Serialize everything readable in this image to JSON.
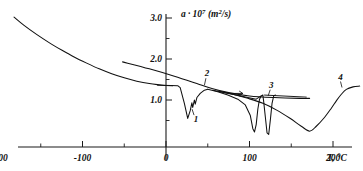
{
  "chart_data": {
    "type": "line",
    "title": "",
    "xlabel": "T, °C",
    "ylabel": "a · 10⁷ (m²/s)",
    "ylabel_parts": {
      "symbol": "a",
      "dot": "·",
      "base": "10",
      "exponent": "7",
      "units": "(m²/s)"
    },
    "xlim": [
      -230,
      245
    ],
    "ylim": [
      0.0,
      3.25
    ],
    "grid": false,
    "legend": "inline-numbered-labels",
    "x_ticks_major": [
      -200,
      -100,
      0,
      100,
      200
    ],
    "x_ticks_major_labels": [
      "-200",
      "-100",
      "0",
      "100",
      "200"
    ],
    "x_ticks_minor": [
      -150,
      -50,
      50,
      150
    ],
    "y_ticks_major": [
      1.0,
      2.0,
      3.0
    ],
    "y_ticks_major_labels": [
      "1.0",
      "2.0",
      "3.0"
    ],
    "y_ticks_minor": [
      0.5,
      1.5,
      2.5
    ],
    "series": [
      {
        "name": "background-decay-curve",
        "label": "",
        "comment": "smooth monotonic decay from low temperature",
        "points": [
          [
            -182,
            3.02
          ],
          [
            -170,
            2.82
          ],
          [
            -155,
            2.6
          ],
          [
            -140,
            2.4
          ],
          [
            -125,
            2.22
          ],
          [
            -110,
            2.05
          ],
          [
            -95,
            1.9
          ],
          [
            -80,
            1.76
          ],
          [
            -65,
            1.64
          ],
          [
            -50,
            1.54
          ],
          [
            -35,
            1.46
          ],
          [
            -20,
            1.4
          ],
          [
            -8,
            1.37
          ],
          [
            0,
            1.355
          ],
          [
            8,
            1.35
          ]
        ]
      },
      {
        "name": "curve-1",
        "label": "1",
        "comment": "plateau then sharp deep dip near 27 C with zigzag recovery",
        "points": [
          [
            -10,
            1.36
          ],
          [
            6,
            1.355
          ],
          [
            14,
            1.35
          ],
          [
            17,
            1.3
          ],
          [
            22,
            0.92
          ],
          [
            26,
            0.55
          ],
          [
            29,
            0.74
          ],
          [
            31,
            0.93
          ],
          [
            32,
            0.82
          ],
          [
            34,
            1.0
          ],
          [
            35,
            0.9
          ],
          [
            37,
            1.06
          ],
          [
            41,
            1.16
          ],
          [
            46,
            1.24
          ],
          [
            50,
            1.26
          ]
        ],
        "label_pos": [
          36,
          0.46
        ]
      },
      {
        "name": "curve-2",
        "label": "2",
        "comment": "straight descending baseline from -50 C crossing to the right",
        "points": [
          [
            -52,
            1.93
          ],
          [
            -20,
            1.76
          ],
          [
            10,
            1.58
          ],
          [
            40,
            1.38
          ],
          [
            55,
            1.28
          ],
          [
            75,
            1.18
          ],
          [
            100,
            1.1
          ],
          [
            130,
            1.06
          ],
          [
            160,
            1.04
          ],
          [
            172,
            1.04
          ]
        ],
        "label_pos": [
          49,
          1.58
        ]
      },
      {
        "name": "curve-2-dip-a",
        "label": "",
        "comment": "narrow deep dip near 105 C",
        "points": [
          [
            50,
            1.26
          ],
          [
            62,
            1.2
          ],
          [
            74,
            1.12
          ],
          [
            86,
            1.02
          ],
          [
            95,
            0.88
          ],
          [
            101,
            0.62
          ],
          [
            104,
            0.3
          ],
          [
            106,
            0.22
          ],
          [
            108,
            0.4
          ],
          [
            110,
            0.78
          ],
          [
            112,
            1.02
          ],
          [
            114,
            1.1
          ]
        ]
      },
      {
        "name": "curve-3",
        "label": "3",
        "comment": "narrow deep dip near 122 C with horizontal plateau afterwards",
        "points": [
          [
            56,
            1.24
          ],
          [
            70,
            1.18
          ],
          [
            84,
            1.12
          ],
          [
            98,
            1.06
          ],
          [
            108,
            1.02
          ],
          [
            114,
            1.1
          ],
          [
            116,
            1.12
          ],
          [
            117,
            0.96
          ],
          [
            119,
            0.58
          ],
          [
            121,
            0.2
          ],
          [
            123,
            0.16
          ],
          [
            125,
            0.52
          ],
          [
            127,
            0.92
          ],
          [
            129,
            1.1
          ],
          [
            131,
            1.12
          ]
        ],
        "label_pos": [
          126,
          1.3
        ],
        "plateau": [
          [
            118,
            1.12
          ],
          [
            168,
            1.07
          ]
        ]
      },
      {
        "name": "curve-4",
        "label": "4",
        "comment": "broad shallow V dip centered near 172 C recovering to plateau",
        "points": [
          [
            62,
            1.22
          ],
          [
            80,
            1.14
          ],
          [
            98,
            1.04
          ],
          [
            116,
            0.92
          ],
          [
            132,
            0.76
          ],
          [
            148,
            0.56
          ],
          [
            162,
            0.36
          ],
          [
            172,
            0.24
          ],
          [
            180,
            0.36
          ],
          [
            190,
            0.58
          ],
          [
            198,
            0.8
          ],
          [
            204,
            0.98
          ],
          [
            210,
            1.14
          ],
          [
            216,
            1.26
          ],
          [
            224,
            1.32
          ],
          [
            232,
            1.34
          ]
        ],
        "label_pos": [
          209,
          1.5
        ]
      }
    ],
    "annotations": [
      {
        "name": "right-arrow-marker",
        "text": "",
        "x_start": 74,
        "x_end": 92,
        "y": 1.16
      }
    ]
  },
  "figure": {
    "background_color": "#ffffff",
    "line_color": "#111111",
    "axis_color": "#1a1a1a"
  }
}
